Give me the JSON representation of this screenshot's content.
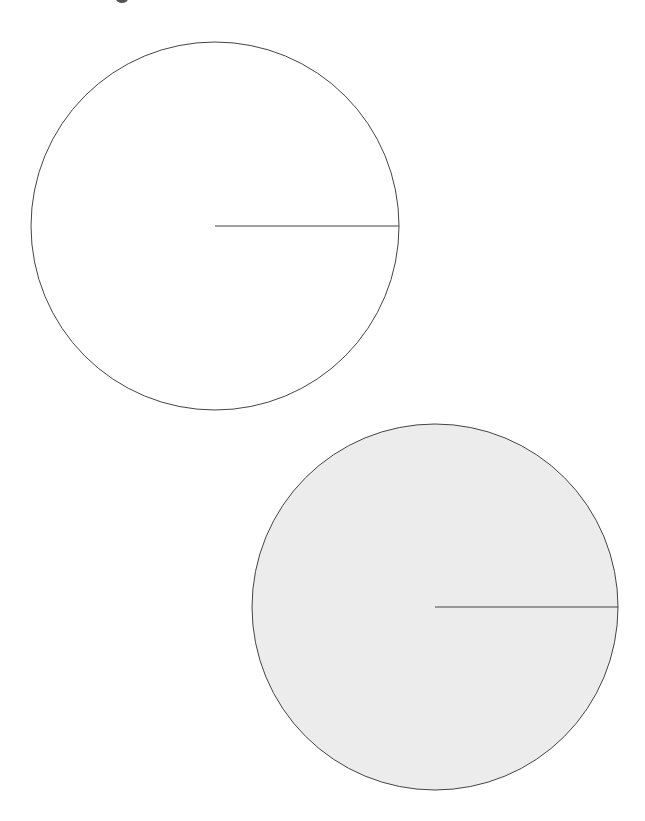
{
  "figure": {
    "width": 645,
    "height": 821,
    "background": "#ffffff",
    "stroke_color": "#444444",
    "circles": [
      {
        "name": "circle-outline",
        "cx": 215,
        "cy": 226,
        "r": 184,
        "fill": "#ffffff",
        "radius_line": {
          "x1": 215,
          "y1": 226,
          "x2": 399,
          "y2": 226
        }
      },
      {
        "name": "circle-filled",
        "cx": 435,
        "cy": 607,
        "r": 183,
        "fill": "#ececec",
        "radius_line": {
          "x1": 435,
          "y1": 607,
          "x2": 618,
          "y2": 607
        }
      }
    ]
  }
}
